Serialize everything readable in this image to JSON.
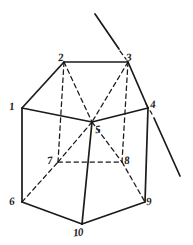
{
  "figure": {
    "style": "hand-drawn pen sketch on white paper",
    "ink_color": "#1a1a1a",
    "background_color": "#ffffff",
    "width": 193,
    "height": 245,
    "vertices": [
      {
        "id": "v1",
        "label": "1",
        "x": 22,
        "y": 108,
        "hidden": false,
        "label_x": 9,
        "label_y": 101
      },
      {
        "id": "v2",
        "label": "2",
        "x": 64,
        "y": 62,
        "hidden": false,
        "label_x": 58,
        "label_y": 52
      },
      {
        "id": "v3",
        "label": "3",
        "x": 128,
        "y": 62,
        "hidden": false,
        "label_x": 126,
        "label_y": 52
      },
      {
        "id": "v4",
        "label": "4",
        "x": 148,
        "y": 108,
        "hidden": false,
        "label_x": 150,
        "label_y": 99
      },
      {
        "id": "v5",
        "label": "5",
        "x": 92,
        "y": 122,
        "hidden": false,
        "label_x": 95,
        "label_y": 124
      },
      {
        "id": "v6",
        "label": "6",
        "x": 22,
        "y": 202,
        "hidden": false,
        "label_x": 9,
        "label_y": 196
      },
      {
        "id": "v7",
        "label": "7",
        "x": 58,
        "y": 162,
        "hidden": true,
        "label_x": 47,
        "label_y": 155
      },
      {
        "id": "v8",
        "label": "8",
        "x": 122,
        "y": 162,
        "hidden": true,
        "label_x": 124,
        "label_y": 155
      },
      {
        "id": "v9",
        "label": "9",
        "x": 145,
        "y": 202,
        "hidden": false,
        "label_x": 146,
        "label_y": 196
      },
      {
        "id": "v10",
        "label": "10",
        "x": 82,
        "y": 224,
        "hidden": false,
        "label_x": 73,
        "label_y": 227
      }
    ],
    "solid_edges": [
      {
        "name": "edge-1-2",
        "from": "v1",
        "to": "v2"
      },
      {
        "name": "edge-2-3",
        "from": "v2",
        "to": "v3"
      },
      {
        "name": "edge-3-4",
        "from": "v3",
        "to": "v4"
      },
      {
        "name": "edge-1-5",
        "from": "v1",
        "to": "v5"
      },
      {
        "name": "edge-5-4",
        "from": "v5",
        "to": "v4"
      },
      {
        "name": "edge-1-6",
        "from": "v1",
        "to": "v6"
      },
      {
        "name": "edge-5-10",
        "from": "v5",
        "to": "v10"
      },
      {
        "name": "edge-4-9",
        "from": "v4",
        "to": "v9"
      },
      {
        "name": "edge-6-10",
        "from": "v6",
        "to": "v10"
      },
      {
        "name": "edge-10-9",
        "from": "v10",
        "to": "v9"
      }
    ],
    "dashed_edges": [
      {
        "name": "edge-2-5-hidden",
        "from": "v2",
        "to": "v5"
      },
      {
        "name": "edge-3-5-hidden",
        "from": "v3",
        "to": "v5"
      },
      {
        "name": "edge-2-7-hidden",
        "from": "v2",
        "to": "v7"
      },
      {
        "name": "edge-3-8-hidden",
        "from": "v3",
        "to": "v8"
      },
      {
        "name": "edge-7-8-hidden",
        "from": "v7",
        "to": "v8"
      },
      {
        "name": "edge-6-7-hidden",
        "from": "v6",
        "to": "v7"
      },
      {
        "name": "edge-8-9-hidden",
        "from": "v8",
        "to": "v9"
      },
      {
        "name": "edge-5-7-hidden",
        "from": "v5",
        "to": "v7"
      },
      {
        "name": "edge-5-8-hidden",
        "from": "v5",
        "to": "v8"
      }
    ],
    "cutting_line": {
      "name": "cutting-line",
      "description": "straight line crossing the prism from upper-left to lower-right",
      "segments": [
        {
          "name": "cutting-line-upper",
          "x1": 95,
          "y1": 14,
          "x2": 119,
          "y2": 49,
          "style": "solid"
        },
        {
          "name": "cutting-line-gap",
          "x1": 120,
          "y1": 51,
          "x2": 126,
          "y2": 59,
          "style": "dashed"
        },
        {
          "name": "cutting-line-mid",
          "x1": 146,
          "y1": 104,
          "x2": 152,
          "y2": 114,
          "style": "dashed"
        },
        {
          "name": "cutting-line-lower",
          "x1": 154,
          "y1": 118,
          "x2": 180,
          "y2": 176,
          "style": "solid"
        }
      ]
    }
  }
}
